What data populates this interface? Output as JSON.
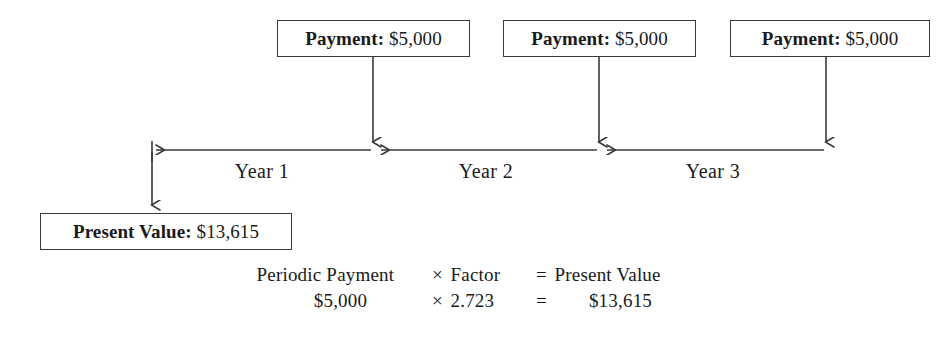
{
  "diagram": {
    "stroke_color": "#3a3a3a",
    "text_color": "#1a1a1a",
    "background_color": "#ffffff"
  },
  "payments": [
    {
      "label": "Payment:",
      "amount": "$5,000"
    },
    {
      "label": "Payment:",
      "amount": "$5,000"
    },
    {
      "label": "Payment:",
      "amount": "$5,000"
    }
  ],
  "present_value": {
    "label": "Present Value:",
    "amount": "$13,615"
  },
  "timeline": {
    "years": [
      {
        "label": "Year 1"
      },
      {
        "label": "Year 2"
      },
      {
        "label": "Year 3"
      }
    ]
  },
  "formula": {
    "words": {
      "term1": "Periodic Payment",
      "op1": "×",
      "term2": "Factor",
      "op2": "=",
      "term3": "Present Value"
    },
    "values": {
      "term1": "$5,000",
      "op1": "×",
      "term2": "2.723",
      "op2": "=",
      "term3": "$13,615"
    }
  }
}
